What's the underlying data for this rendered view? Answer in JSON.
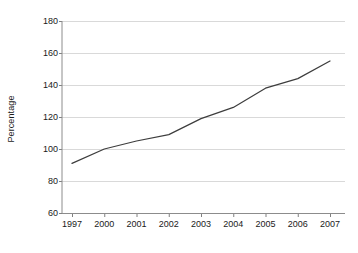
{
  "chart_data": {
    "type": "line",
    "title": "",
    "xlabel": "",
    "ylabel": "Percentage",
    "categories": [
      "1997",
      "2000",
      "2001",
      "2002",
      "2003",
      "2004",
      "2005",
      "2006",
      "2007"
    ],
    "values": [
      91,
      100,
      105,
      109,
      119,
      126,
      138,
      144,
      155
    ],
    "series": [
      {
        "name": "Percentage",
        "values": [
          91,
          100,
          105,
          109,
          119,
          126,
          138,
          144,
          155
        ]
      }
    ],
    "ylim": [
      60,
      180
    ],
    "y_ticks": [
      60,
      80,
      100,
      120,
      140,
      160,
      180
    ],
    "y_tick_labels": [
      "60",
      "80",
      "100",
      "120",
      "140",
      "160",
      "180"
    ],
    "grid": "horizontal",
    "legend": "none",
    "line_color": "#3d3d3d",
    "grid_color": "#d9d9d9",
    "axis_color": "#808080",
    "background": "#ffffff"
  },
  "figure": {
    "y_axis_title": "Percentage"
  }
}
